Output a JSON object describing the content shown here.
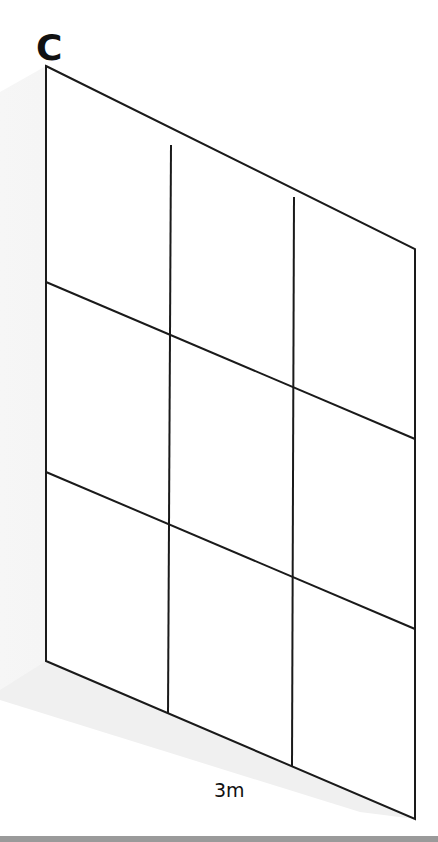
{
  "panel": {
    "label": "C",
    "dimension_label": "3m"
  },
  "grid": {
    "rows": 3,
    "columns": 3,
    "stroke_color": "#1a1a1a",
    "shadow_color": "#efefef",
    "corners": {
      "top_left": [
        46,
        66
      ],
      "top_right": [
        415,
        249
      ],
      "bottom_right": [
        415,
        819
      ],
      "bottom_left": [
        46,
        661
      ]
    },
    "vertical_lines": [
      {
        "top": [
          171,
          145
        ],
        "bottom": [
          168,
          714
        ]
      },
      {
        "top": [
          294,
          197
        ],
        "bottom": [
          292,
          766
        ]
      }
    ],
    "horizontal_lines": [
      {
        "left": [
          46,
          282
        ],
        "right": [
          415,
          439
        ]
      },
      {
        "left": [
          46,
          472
        ],
        "right": [
          415,
          629
        ]
      }
    ]
  },
  "colors": {
    "background": "#ffffff",
    "bottom_bar": "#9a9a9a"
  }
}
